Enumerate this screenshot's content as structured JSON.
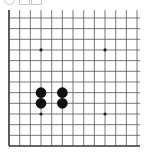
{
  "toolbar": {
    "icons": [
      {
        "name": "circle-icon",
        "shape": "circle"
      },
      {
        "name": "square-icon",
        "shape": "square"
      },
      {
        "name": "square-icon-2",
        "shape": "square"
      }
    ]
  },
  "board": {
    "size": 13,
    "origin_x": 9,
    "bottom_y": 146,
    "spacing": 10.67,
    "line_color": "#555555",
    "border_color": "#333333",
    "background": "#ffffff",
    "visible_rows_from_bottom": 13,
    "star_points": [
      {
        "col": 3,
        "row": 3
      },
      {
        "col": 9,
        "row": 3
      },
      {
        "col": 3,
        "row": 9
      },
      {
        "col": 9,
        "row": 9
      }
    ],
    "stones": [
      {
        "col": 3,
        "row": 4,
        "color": "black"
      },
      {
        "col": 3,
        "row": 5,
        "color": "black"
      },
      {
        "col": 5,
        "row": 4,
        "color": "black"
      },
      {
        "col": 5,
        "row": 5,
        "color": "black"
      }
    ],
    "stone_colors": {
      "black": "#111111",
      "white": "#ffffff"
    }
  }
}
